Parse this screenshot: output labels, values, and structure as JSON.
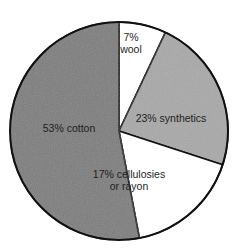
{
  "chart_data": {
    "type": "pie",
    "title": "",
    "start_angle_deg": 0,
    "direction": "clockwise",
    "slices": [
      {
        "label": "wool",
        "display": [
          "7%",
          "wool"
        ],
        "value": 7,
        "color": "#ffffff",
        "label_pos": [
          131,
          41
        ]
      },
      {
        "label": "synthetics",
        "display": [
          "23% synthetics"
        ],
        "value": 23,
        "color": "#a9a9a9",
        "label_pos": [
          171,
          122
        ]
      },
      {
        "label": "cellulosies or rayon",
        "display": [
          "17% cellulosies",
          "or rayon"
        ],
        "value": 17,
        "color": "#ffffff",
        "label_pos": [
          129,
          178
        ]
      },
      {
        "label": "cotton",
        "display": [
          "53% cotton"
        ],
        "value": 53,
        "color": "#7e7e7e",
        "label_pos": [
          69,
          132
        ]
      }
    ],
    "geometry": {
      "cx": 119,
      "cy": 131,
      "r": 109
    }
  }
}
